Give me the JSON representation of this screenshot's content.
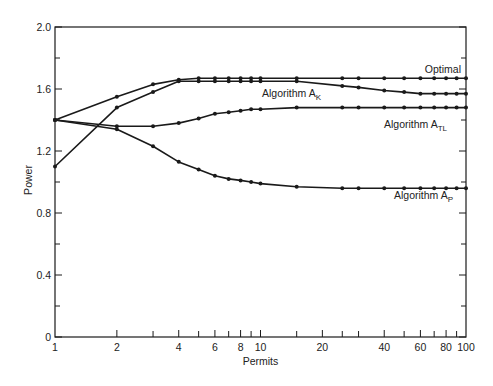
{
  "chart_data": {
    "type": "line",
    "title": "",
    "xlabel": "Permits",
    "ylabel": "Power",
    "xscale": "log",
    "xlim": [
      1,
      100
    ],
    "ylim": [
      0,
      2.0
    ],
    "grid": false,
    "legend_position": "inline labels at right end of curves",
    "x_tick_labels": [
      "1",
      "2",
      "4",
      "6",
      "8",
      "10",
      "20",
      "40",
      "60",
      "80",
      "100"
    ],
    "x_tick_values": [
      1,
      2,
      4,
      6,
      8,
      10,
      20,
      40,
      60,
      80,
      100
    ],
    "x_minor_ticks": [
      3,
      5,
      7,
      9,
      15,
      25,
      30,
      50,
      70,
      90
    ],
    "y_tick_labels": [
      "0",
      "0.4",
      "0.8",
      "1.2",
      "1.6",
      "2.0"
    ],
    "y_tick_values": [
      0,
      0.4,
      0.8,
      1.2,
      1.6,
      2.0
    ],
    "y_minor_ticks": [
      0.2,
      0.6,
      1.0,
      1.4,
      1.8
    ],
    "x": [
      1,
      2,
      3,
      4,
      5,
      6,
      7,
      8,
      9,
      10,
      15,
      25,
      30,
      40,
      50,
      60,
      70,
      80,
      90,
      100
    ],
    "series": [
      {
        "name": "Optimal",
        "label": "Optimal",
        "label_sub": "",
        "values": [
          1.4,
          1.55,
          1.63,
          1.66,
          1.67,
          1.67,
          1.67,
          1.67,
          1.67,
          1.67,
          1.67,
          1.67,
          1.67,
          1.67,
          1.67,
          1.67,
          1.67,
          1.67,
          1.67,
          1.67
        ]
      },
      {
        "name": "Algorithm A_K",
        "label": "Algorithm A",
        "label_sub": "K",
        "values": [
          1.1,
          1.48,
          1.58,
          1.65,
          1.65,
          1.65,
          1.65,
          1.65,
          1.65,
          1.65,
          1.65,
          1.62,
          1.61,
          1.59,
          1.58,
          1.57,
          1.57,
          1.57,
          1.57,
          1.57
        ]
      },
      {
        "name": "Algorithm A_TL",
        "label": "Algorithm A",
        "label_sub": "TL",
        "values": [
          1.4,
          1.36,
          1.36,
          1.38,
          1.41,
          1.44,
          1.45,
          1.46,
          1.47,
          1.47,
          1.48,
          1.48,
          1.48,
          1.48,
          1.48,
          1.48,
          1.48,
          1.48,
          1.48,
          1.48
        ]
      },
      {
        "name": "Algorithm A_P",
        "label": "Algorithm A",
        "label_sub": "P",
        "values": [
          1.4,
          1.34,
          1.23,
          1.13,
          1.08,
          1.04,
          1.02,
          1.01,
          1.0,
          0.99,
          0.97,
          0.96,
          0.96,
          0.96,
          0.96,
          0.96,
          0.96,
          0.96,
          0.96,
          0.96
        ]
      }
    ],
    "annotations": [
      {
        "text": "Optimal",
        "x": 60,
        "y": 1.7
      },
      {
        "text": "Algorithm A_K",
        "x": 10,
        "y": 1.59
      },
      {
        "text": "Algorithm A_TL",
        "x": 45,
        "y": 1.42
      },
      {
        "text": "Algorithm A_P",
        "x": 48,
        "y": 0.9
      }
    ]
  }
}
